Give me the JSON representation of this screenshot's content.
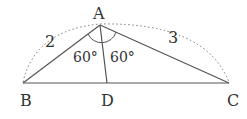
{
  "diagram": {
    "type": "triangle-with-angle-bisector",
    "points": {
      "A": {
        "label": "A"
      },
      "B": {
        "label": "B"
      },
      "C": {
        "label": "C"
      },
      "D": {
        "label": "D"
      }
    },
    "side_labels": {
      "AB": "2",
      "AC": "3"
    },
    "angle_labels": {
      "BAD": "60°",
      "DAC": "60°"
    },
    "colors": {
      "line": "#555555",
      "text": "#333333"
    }
  }
}
